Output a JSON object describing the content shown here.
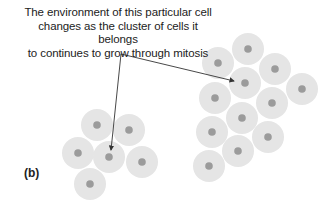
{
  "caption": {
    "line1": "The environment of this particular cell",
    "line2": "changes as the cluster of cells it belongs",
    "line3": "to continues to grow through mitosis"
  },
  "panel_label": "(b)",
  "colors": {
    "cell_fill": "#e5e5e5",
    "nucleus": "#9b9b9b",
    "arrow": "#333333",
    "text": "#222222"
  },
  "small_cluster": [
    {
      "x": 97,
      "y": 125
    },
    {
      "x": 129,
      "y": 130
    },
    {
      "x": 78,
      "y": 153
    },
    {
      "x": 109,
      "y": 157
    },
    {
      "x": 142,
      "y": 162
    },
    {
      "x": 90,
      "y": 184
    }
  ],
  "large_cluster": [
    {
      "x": 248,
      "y": 49
    },
    {
      "x": 218,
      "y": 63
    },
    {
      "x": 275,
      "y": 69
    },
    {
      "x": 245,
      "y": 83
    },
    {
      "x": 302,
      "y": 89
    },
    {
      "x": 215,
      "y": 98
    },
    {
      "x": 272,
      "y": 103
    },
    {
      "x": 242,
      "y": 118
    },
    {
      "x": 212,
      "y": 132
    },
    {
      "x": 268,
      "y": 137
    },
    {
      "x": 238,
      "y": 151
    },
    {
      "x": 209,
      "y": 166
    }
  ],
  "arrows": {
    "origin": {
      "x": 121,
      "y": 54
    },
    "targets": [
      {
        "x": 234,
        "y": 81
      },
      {
        "x": 111,
        "y": 150
      }
    ]
  }
}
